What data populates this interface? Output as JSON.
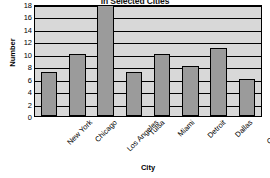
{
  "chart_data": {
    "type": "bar",
    "title": "in Selected Cities",
    "xlabel": "City",
    "ylabel": "Number",
    "categories": [
      "New York",
      "Chicago",
      "Los Angeles",
      "Tulsa",
      "Miami",
      "Detroit",
      "Dallas",
      "Charlotte"
    ],
    "values": [
      7,
      10,
      18,
      7,
      10,
      8,
      11,
      6
    ],
    "ylim": [
      0,
      18
    ],
    "ytick_labels": [
      "0",
      "2",
      "4",
      "6",
      "8",
      "10",
      "12",
      "14",
      "16",
      "18"
    ],
    "ytick_values": [
      0,
      2,
      4,
      6,
      8,
      10,
      12,
      14,
      16,
      18
    ],
    "grid": true,
    "legend": "none",
    "bar_color": "#9b9b9b",
    "bar_edge_color": "#000000",
    "plot_background": "#d8d8d8"
  }
}
